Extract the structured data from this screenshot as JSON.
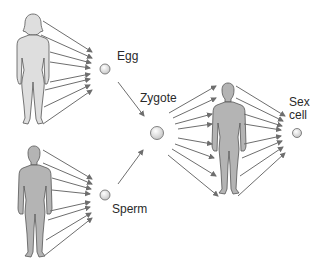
{
  "diagram": {
    "labels": {
      "egg": "Egg",
      "zygote": "Zygote",
      "sperm": "Sperm",
      "sex_cell_line1": "Sex",
      "sex_cell_line2": "cell"
    },
    "figures": [
      "female-adult",
      "male-adult",
      "male-offspring"
    ],
    "colors": {
      "arrow": "#6e6e6e",
      "female_fill": "#dedede",
      "male_fill": "#b4b4b4",
      "outline": "#555555",
      "cell_fill": "#e6e6e6"
    }
  }
}
